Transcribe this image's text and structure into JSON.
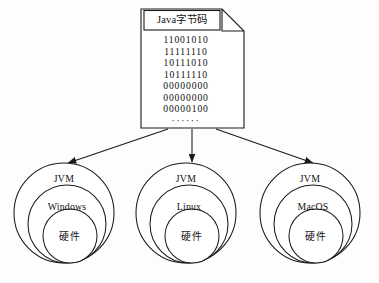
{
  "diagram": {
    "title": "Java字节码",
    "document": {
      "label": "Java字节码",
      "code_lines": [
        "11001010",
        "11111110",
        "10111010",
        "10111110",
        "00000000",
        "00000000",
        "00000100"
      ],
      "ellipsis": "······"
    },
    "platforms": [
      {
        "vm_label": "JVM",
        "os_label": "Windows",
        "hardware_label": "硬件"
      },
      {
        "vm_label": "JVM",
        "os_label": "Linux",
        "hardware_label": "硬件"
      },
      {
        "vm_label": "JVM",
        "os_label": "MacOS",
        "hardware_label": "硬件"
      }
    ],
    "colors": {
      "stroke": "#1a1a1a",
      "background": "#fdfdfd",
      "text": "#111111"
    }
  }
}
